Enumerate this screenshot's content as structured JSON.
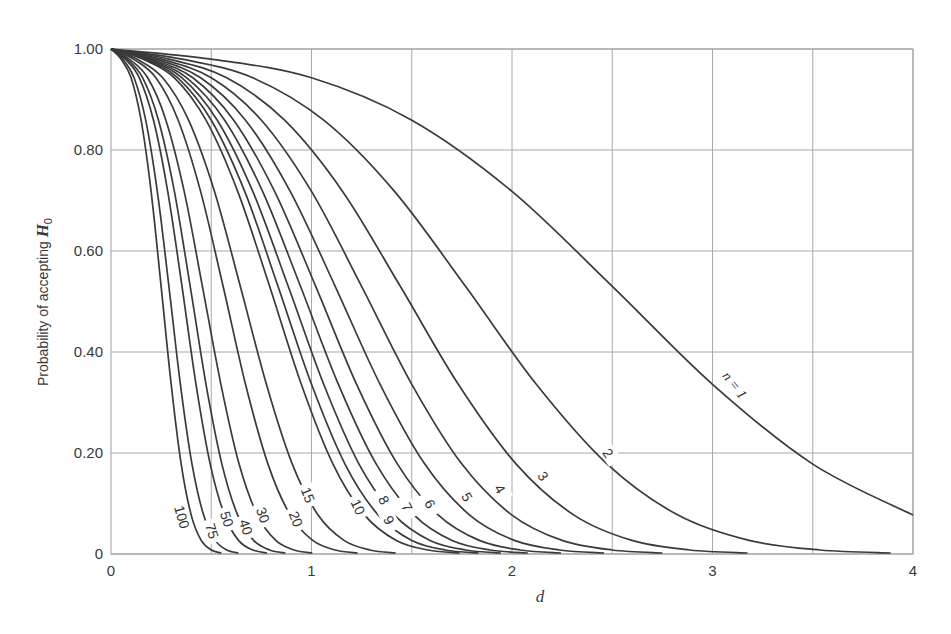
{
  "chart_data": {
    "type": "line",
    "title": "",
    "xlabel": "d",
    "ylabel": "Probability of accepting H0",
    "ylabel_main": "Probability of accepting ",
    "ylabel_symbol": "H",
    "ylabel_subscript": "0",
    "xlim": [
      0,
      4
    ],
    "ylim": [
      0,
      1
    ],
    "x_ticks": [
      0,
      1,
      2,
      3,
      4
    ],
    "x_tick_labels": [
      "0",
      "1",
      "2",
      "3",
      "4"
    ],
    "x_grid": [
      0.5,
      1,
      1.5,
      2,
      2.5,
      3,
      3.5,
      4
    ],
    "y_ticks": [
      0,
      0.2,
      0.4,
      0.6,
      0.8,
      1.0
    ],
    "y_tick_labels": [
      "0",
      "0.20",
      "0.40",
      "0.60",
      "0.80",
      "1.00"
    ],
    "grid": true,
    "legend": "inline curve labels",
    "y": [
      0.99,
      0.98,
      0.943,
      0.859,
      0.718,
      0.53,
      0.336,
      0.178,
      0.077,
      0.027,
      0.008,
      0.002
    ],
    "series": [
      {
        "name": "1",
        "label": "n = 1",
        "x": [
          0,
          0.5,
          1,
          1.5,
          2,
          2.5,
          3,
          3.5,
          4
        ],
        "label_pos": [
          735,
          385
        ],
        "label_rot": 52
      },
      {
        "name": "2",
        "label": "2",
        "x": [
          0,
          0.354,
          0.707,
          1.061,
          1.414,
          1.768,
          2.121,
          2.475,
          2.828,
          3.182,
          3.536,
          3.889
        ],
        "label_pos": [
          608,
          453
        ],
        "label_rot": 55
      },
      {
        "name": "3",
        "label": "3",
        "x": [
          0,
          0.289,
          0.577,
          0.866,
          1.155,
          1.443,
          1.732,
          2.021,
          2.309,
          2.598,
          2.887,
          3.175
        ],
        "label_pos": [
          543,
          476
        ],
        "label_rot": 55
      },
      {
        "name": "4",
        "label": "4",
        "x": [
          0,
          0.25,
          0.5,
          0.75,
          1,
          1.25,
          1.5,
          1.75,
          2,
          2.25,
          2.5,
          2.75
        ],
        "label_pos": [
          500,
          489
        ],
        "label_rot": 58
      },
      {
        "name": "5",
        "label": "5",
        "x": [
          0,
          0.224,
          0.447,
          0.671,
          0.894,
          1.118,
          1.342,
          1.565,
          1.789,
          2.012,
          2.236,
          2.46
        ],
        "label_pos": [
          467,
          497
        ],
        "label_rot": 60
      },
      {
        "name": "6",
        "label": "6",
        "x": [
          0,
          0.204,
          0.408,
          0.612,
          0.816,
          1.021,
          1.225,
          1.429,
          1.633,
          1.837,
          2.041,
          2.245
        ],
        "label_pos": [
          430,
          504
        ],
        "label_rot": 60
      },
      {
        "name": "7",
        "label": "7",
        "x": [
          0,
          0.189,
          0.378,
          0.567,
          0.756,
          0.945,
          1.134,
          1.323,
          1.512,
          1.701,
          1.89,
          2.079
        ],
        "label_pos": [
          407,
          507
        ],
        "label_rot": 62
      },
      {
        "name": "8",
        "label": "8",
        "x": [
          0,
          0.177,
          0.354,
          0.53,
          0.707,
          0.884,
          1.061,
          1.237,
          1.414,
          1.591,
          1.768,
          1.945
        ],
        "label_pos": [
          384,
          500
        ],
        "label_rot": 62
      },
      {
        "name": "9",
        "label": "9",
        "x": [
          0,
          0.167,
          0.333,
          0.5,
          0.667,
          0.833,
          1,
          1.167,
          1.333,
          1.5,
          1.667,
          1.833
        ],
        "label_pos": [
          389,
          520
        ],
        "label_rot": 62
      },
      {
        "name": "10",
        "label": "10",
        "x": [
          0,
          0.158,
          0.316,
          0.474,
          0.632,
          0.791,
          0.949,
          1.107,
          1.265,
          1.423,
          1.581,
          1.739
        ],
        "label_pos": [
          358,
          507
        ],
        "label_rot": 65
      },
      {
        "name": "15",
        "label": "15",
        "x": [
          0,
          0.129,
          0.258,
          0.387,
          0.516,
          0.645,
          0.775,
          0.904,
          1.033,
          1.162,
          1.291,
          1.42
        ],
        "label_pos": [
          308,
          495
        ],
        "label_rot": 68
      },
      {
        "name": "20",
        "label": "20",
        "x": [
          0,
          0.112,
          0.224,
          0.335,
          0.447,
          0.559,
          0.671,
          0.783,
          0.894,
          1.006,
          1.118,
          1.23
        ],
        "label_pos": [
          296,
          519
        ],
        "label_rot": 68
      },
      {
        "name": "30",
        "label": "30",
        "x": [
          0,
          0.091,
          0.183,
          0.274,
          0.365,
          0.456,
          0.548,
          0.639,
          0.73,
          0.822,
          0.913,
          1.004
        ],
        "label_pos": [
          263,
          515
        ],
        "label_rot": 70
      },
      {
        "name": "40",
        "label": "40",
        "x": [
          0,
          0.079,
          0.158,
          0.237,
          0.316,
          0.395,
          0.474,
          0.553,
          0.632,
          0.711,
          0.791,
          0.87
        ],
        "label_pos": [
          246,
          527
        ],
        "label_rot": 72
      },
      {
        "name": "50",
        "label": "50",
        "x": [
          0,
          0.071,
          0.141,
          0.212,
          0.283,
          0.354,
          0.424,
          0.495,
          0.566,
          0.636,
          0.707,
          0.778
        ],
        "label_pos": [
          227,
          519
        ],
        "label_rot": 72
      },
      {
        "name": "75",
        "label": "75",
        "x": [
          0,
          0.058,
          0.115,
          0.173,
          0.231,
          0.289,
          0.346,
          0.404,
          0.462,
          0.52,
          0.577,
          0.635
        ],
        "label_pos": [
          212,
          531
        ],
        "label_rot": 74
      },
      {
        "name": "100",
        "label": "100",
        "x": [
          0,
          0.05,
          0.1,
          0.15,
          0.2,
          0.25,
          0.3,
          0.35,
          0.4,
          0.45,
          0.5,
          0.55
        ],
        "label_pos": [
          182,
          517
        ],
        "label_rot": 74
      }
    ]
  },
  "layout": {
    "plot_left": 111,
    "plot_right": 913,
    "plot_top": 49,
    "plot_bottom": 554,
    "line_color": "#3a3a3a",
    "grid_color": "#a8a8a8"
  }
}
